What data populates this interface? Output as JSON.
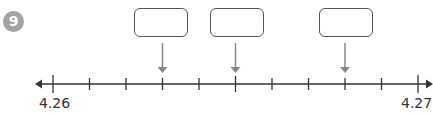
{
  "question": {
    "number": "9"
  },
  "number_line": {
    "start_label": "4.26",
    "end_label": "4.27",
    "tick_count": 11,
    "arrow_positions": [
      "4.263",
      "4.265",
      "4.268"
    ]
  },
  "answer_boxes": [
    {
      "value": ""
    },
    {
      "value": ""
    },
    {
      "value": ""
    }
  ],
  "colors": {
    "badge": "#a3a3a3",
    "line": "#333333",
    "pointer": "#888888"
  }
}
